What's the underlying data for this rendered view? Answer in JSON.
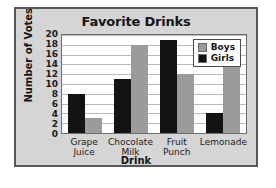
{
  "chart_data": {
    "type": "bar",
    "title": "Favorite Drinks",
    "xlabel": "Drink",
    "ylabel": "Number of Votes",
    "categories": [
      "Grape Juice",
      "Chocolate Milk",
      "Fruit Punch",
      "Lemonade"
    ],
    "category_lines": [
      [
        "Grape",
        "Juice"
      ],
      [
        "Chocolate",
        "Milk"
      ],
      [
        "Fruit",
        "Punch"
      ],
      [
        "Lemonade"
      ]
    ],
    "series": [
      {
        "name": "Girls",
        "color": "#131313",
        "values": [
          8,
          11,
          19,
          4
        ]
      },
      {
        "name": "Boys",
        "color": "#9b9b9b",
        "values": [
          3,
          18,
          12,
          16
        ]
      }
    ],
    "ylim": [
      0,
      20
    ],
    "ytick_values": [
      0,
      2,
      4,
      6,
      8,
      10,
      12,
      14,
      16,
      18,
      20
    ],
    "ytick_labels": [
      "0",
      "2",
      "4",
      "6",
      "8",
      "10",
      "12",
      "14",
      "16",
      "18",
      "20"
    ],
    "grid": true,
    "grid_axis": "y",
    "legend": {
      "position": "top-right-inside",
      "entries": [
        {
          "label": "Boys",
          "color": "#9b9b9b"
        },
        {
          "label": "Girls",
          "color": "#131313"
        }
      ]
    },
    "bar_order_in_group": [
      "Girls",
      "Boys"
    ]
  },
  "style": {
    "panel_background": "#d5d5d5",
    "plot_background": "#ffffff",
    "frame_border": "#58585a",
    "gridline_color": "#b9b9bb",
    "text_color": "#161616"
  }
}
